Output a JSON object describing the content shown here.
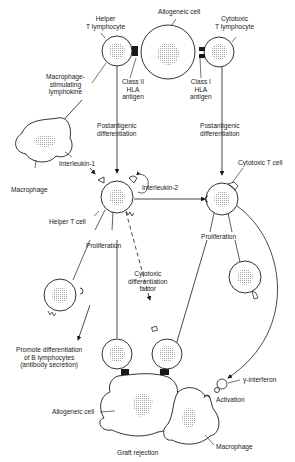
{
  "diagram": {
    "type": "biological-pathway",
    "labels": {
      "helper_t_lymphocyte": "Helper\nT lymphocyte",
      "allogeneic_cell_top": "Allogeneic cell",
      "cytotoxic_t_lymphocyte": "Cytotoxic\nT lymphocyte",
      "class_ii_hla": "Class II\nHLA\nantigen",
      "class_i_hla": "Class I\nHLA\nantigen",
      "macrophage_stimulating_lymphokine": "Macrophage-\nstimulating\nlymphokine",
      "postantigenic_left": "Postantigenic\ndifferentiation",
      "postantigenic_right": "Postantigenic\ndifferentiation",
      "macrophage_left": "Macrophage",
      "interleukin_1": "Interleukin-1",
      "interleukin_2": "Interleukin-2",
      "cytotoxic_t_cell": "Cytotoxic T cell",
      "helper_t_cell": "Helper T cell",
      "proliferation_left": "Proliferation",
      "proliferation_right": "Proliferation",
      "cytotoxic_differentiation_factor": "Cytotoxic\ndifferentiation\nfactor",
      "promote_b_differentiation": "Promote differentiation\nof B lymphocytes\n(antibody secretion)",
      "gamma_interferon": "γ-interferon",
      "activation": "Activation",
      "allogeneic_cell_bottom": "Allogeneic cell",
      "macrophage_bottom": "Macrophage",
      "graft_rejection": "Graft rejection"
    },
    "colors": {
      "line": "#1a1a1a",
      "stipple": "#9a9a9a",
      "background": "#ffffff"
    }
  }
}
